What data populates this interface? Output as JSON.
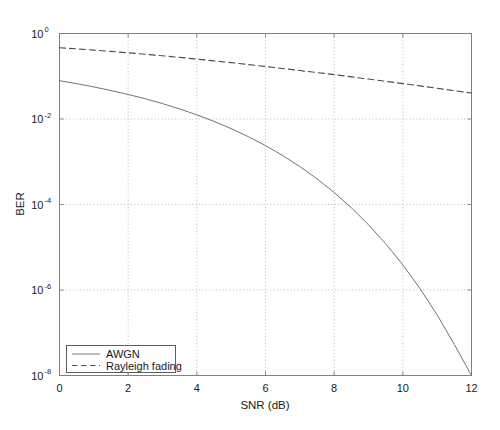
{
  "chart_data": {
    "type": "line",
    "title": "",
    "xlabel": "SNR (dB)",
    "ylabel": "BER",
    "xlim": [
      0,
      12
    ],
    "ylim": [
      1e-08,
      1
    ],
    "yscale": "log",
    "grid": true,
    "legend_position": "lower-left",
    "xticks": [
      0,
      2,
      4,
      6,
      8,
      10,
      12
    ],
    "xtick_labels": [
      "0",
      "2",
      "4",
      "6",
      "8",
      "10",
      "12"
    ],
    "yticks": [
      1,
      0.01,
      0.0001,
      1e-06,
      1e-08
    ],
    "ytick_labels": [
      "10",
      "10",
      "10",
      "10",
      "10"
    ],
    "ytick_exponents": [
      "0",
      "-2",
      "-4",
      "-6",
      "-8"
    ],
    "x": [
      0,
      0.5,
      1,
      1.5,
      2,
      2.5,
      3,
      3.5,
      4,
      4.5,
      5,
      5.5,
      6,
      6.5,
      7,
      7.5,
      8,
      8.5,
      9,
      9.5,
      10,
      10.5,
      11,
      11.5,
      12
    ],
    "series": [
      {
        "name": "AWGN",
        "style": "solid",
        "color": "#6b6b6b",
        "values": [
          0.0786,
          0.0671,
          0.0563,
          0.0463,
          0.0375,
          0.0297,
          0.0229,
          0.0172,
          0.0125,
          0.00879,
          0.00595,
          0.00386,
          0.00239,
          0.0014,
          0.000773,
          0.000399,
          0.000191,
          8.4e-05,
          3.36e-05,
          1.21e-05,
          3.87e-06,
          1.08e-06,
          2.61e-07,
          5.32e-08,
          9.01e-09
        ]
      },
      {
        "name": "Rayleigh fading",
        "style": "dashed",
        "color": "#4d4d4d",
        "values": [
          0.465,
          0.437,
          0.409,
          0.381,
          0.354,
          0.327,
          0.301,
          0.276,
          0.252,
          0.229,
          0.208,
          0.188,
          0.169,
          0.152,
          0.136,
          0.122,
          0.109,
          0.0968,
          0.086,
          0.0762,
          0.0674,
          0.0595,
          0.0524,
          0.0461,
          0.0406
        ]
      }
    ]
  },
  "legend": {
    "entries": [
      {
        "label": "AWGN"
      },
      {
        "label": "Rayleigh fading"
      }
    ]
  },
  "colors": {
    "axis": "#808080",
    "grid": "#b0b0b0",
    "text": "#1a1a1a",
    "awgn": "#6b6b6b",
    "rayleigh": "#4d4d4d",
    "background": "#ffffff"
  }
}
